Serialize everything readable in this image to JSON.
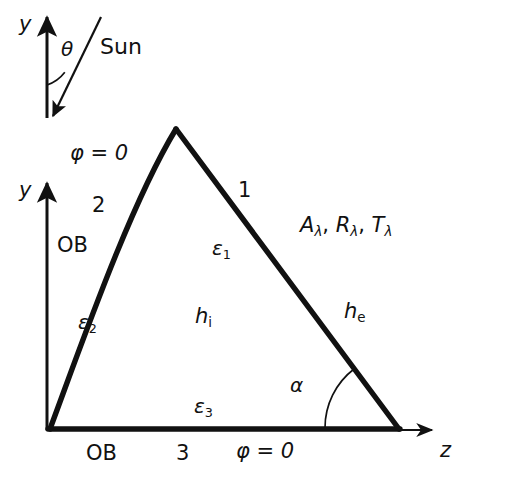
{
  "figure": {
    "kind": "geometry-diagram",
    "stroke_color": "#111111",
    "background_color": "#ffffff",
    "body_line_width": 5,
    "axis_line_width": 2
  },
  "inset_sun": {
    "axis_label_y": "y",
    "angle_label": "θ",
    "ray_label": "Sun"
  },
  "axes": {
    "y_label": "y",
    "z_label": "z"
  },
  "surfaces": [
    {
      "id": "surface-1",
      "number": "1",
      "emissivity": "ε",
      "emissivity_sub": "1"
    },
    {
      "id": "surface-2",
      "number": "2",
      "emissivity": "ε",
      "emissivity_sub": "2"
    },
    {
      "id": "surface-3",
      "number": "3",
      "emissivity": "ε",
      "emissivity_sub": "3"
    }
  ],
  "labels": {
    "phi_top": "φ = 0",
    "phi_bottom": "φ = 0",
    "ob_left": "OB",
    "ob_bottom": "OB",
    "surface_1": "1",
    "surface_2": "2",
    "surface_3": "3",
    "eps_symbol": "ε",
    "eps1_sub": "1",
    "eps2_sub": "2",
    "eps3_sub": "3",
    "optical_A": "A",
    "optical_R": "R",
    "optical_T": "T",
    "optical_sub": "λ",
    "optical_sep1": ", ",
    "optical_sep2": ", ",
    "h_symbol": "h",
    "h_internal_sub": "i",
    "h_external_sub": "e",
    "alpha": "α",
    "theta": "θ",
    "sun": "Sun",
    "y": "y",
    "z": "z"
  }
}
